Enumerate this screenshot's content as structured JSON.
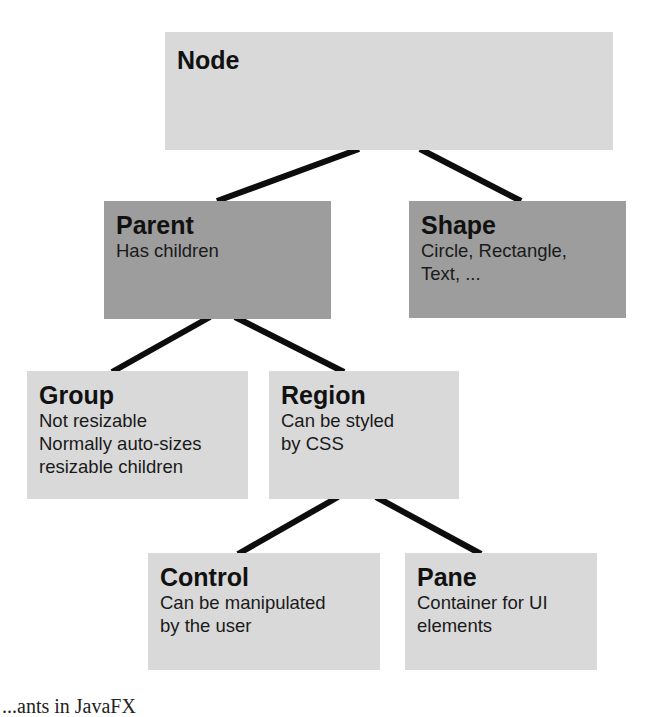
{
  "diagram": {
    "type": "class-hierarchy-tree",
    "nodes": [
      {
        "id": "node",
        "title": "Node",
        "description": "",
        "shade": "light",
        "color": "#d9d9d9"
      },
      {
        "id": "parent",
        "title": "Parent",
        "description": "Has children",
        "shade": "dark",
        "color": "#9d9d9d"
      },
      {
        "id": "shape",
        "title": "Shape",
        "description": "Circle, Rectangle,\nText, ...",
        "shade": "dark",
        "color": "#9d9d9d"
      },
      {
        "id": "group",
        "title": "Group",
        "description": "Not resizable\nNormally auto-sizes\nresizable children",
        "shade": "light",
        "color": "#d9d9d9"
      },
      {
        "id": "region",
        "title": "Region",
        "description": "Can be styled\nby CSS",
        "shade": "light",
        "color": "#d9d9d9"
      },
      {
        "id": "control",
        "title": "Control",
        "description": "Can be manipulated\nby the user",
        "shade": "light",
        "color": "#d9d9d9"
      },
      {
        "id": "pane",
        "title": "Pane",
        "description": "Container for UI\nelements",
        "shade": "light",
        "color": "#d9d9d9"
      }
    ],
    "edges": [
      {
        "from": "node",
        "to": "parent"
      },
      {
        "from": "node",
        "to": "shape"
      },
      {
        "from": "parent",
        "to": "group"
      },
      {
        "from": "parent",
        "to": "region"
      },
      {
        "from": "region",
        "to": "control"
      },
      {
        "from": "region",
        "to": "pane"
      }
    ],
    "caption": "...ants in JavaFX"
  },
  "colors": {
    "light_box": "#d9d9d9",
    "dark_box": "#9d9d9d",
    "connector": "#0d0d0d",
    "background": "#ffffff"
  }
}
